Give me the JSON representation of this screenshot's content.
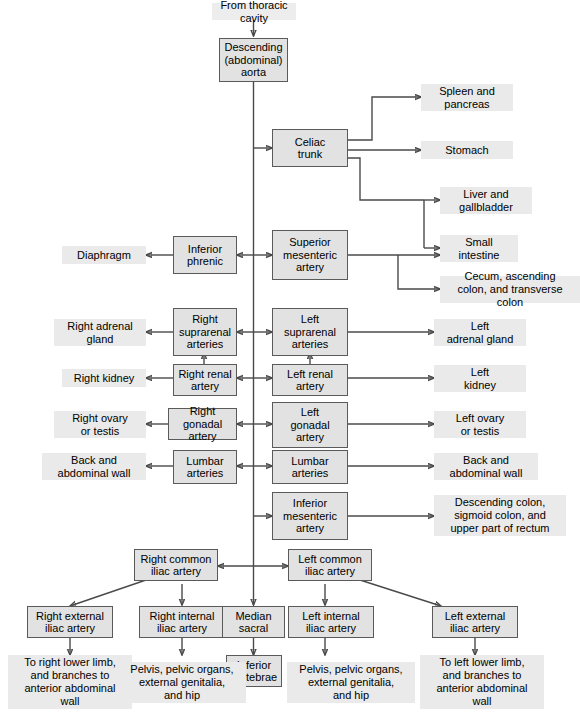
{
  "diagram": {
    "colors": {
      "node_fill": "#e2e2e2",
      "node_border": "#5a5a5a",
      "label_fill": "#ededed",
      "wire": "#4a4a4a",
      "text": "#000000",
      "background": "#ffffff"
    }
  },
  "nodes": {
    "source": "From thoracic cavity",
    "aorta": "Descending\n(abdominal)\naorta",
    "celiac_trunk": "Celiac\ntrunk",
    "inferior_phrenic": "Inferior\nphrenic",
    "superior_mesenteric": "Superior\nmesenteric\nartery",
    "right_suprarenal": "Right\nsuprarenal\narteries",
    "left_suprarenal": "Left\nsuprarenal\narteries",
    "right_renal": "Right renal\nartery",
    "left_renal": "Left renal artery",
    "right_gonadal": "Right gonadal\nartery",
    "left_gonadal": "Left\ngonadal\nartery",
    "right_lumbar": "Lumbar\narteries",
    "left_lumbar": "Lumbar\narteries",
    "inferior_mesenteric": "Inferior\nmesenteric\nartery",
    "right_common_iliac": "Right common\niliac artery",
    "left_common_iliac": "Left common\niliac artery",
    "right_external_iliac": "Right external\niliac artery",
    "right_internal_iliac": "Right internal\niliac artery",
    "median_sacral": "Median\nsacral",
    "left_internal_iliac": "Left internal\niliac artery",
    "left_external_iliac": "Left external\niliac artery",
    "inferior_vertebrae": "Inferior\nvertebrae"
  },
  "targets": {
    "spleen_pancreas": "Spleen and\npancreas",
    "stomach": "Stomach",
    "liver_gallbladder": "Liver and\ngallbladder",
    "small_intestine": "Small\nintestine",
    "cecum_colon": "Cecum, ascending\ncolon, and transverse colon",
    "diaphragm": "Diaphragm",
    "right_adrenal_gland": "Right adrenal\ngland",
    "left_adrenal_gland": "Left\nadrenal gland",
    "right_kidney": "Right kidney",
    "left_kidney": "Left\nkidney",
    "right_ovary_testis": "Right ovary\nor testis",
    "left_ovary_testis": "Left ovary\nor testis",
    "right_back_wall": "Back and\nabdominal wall",
    "left_back_wall": "Back and\nabdominal wall",
    "descending_sigmoid_rectum": "Descending colon,\nsigmoid colon, and\nupper part of rectum",
    "right_lower_limb": "To right lower limb,\nand branches to\nanterior abdominal\nwall",
    "right_pelvis": "Pelvis, pelvic organs,\nexternal genitalia,\nand hip",
    "left_pelvis": "Pelvis, pelvic organs,\nexternal genitalia,\nand hip",
    "left_lower_limb": "To left lower limb,\nand branches to\nanterior abdominal\nwall"
  }
}
